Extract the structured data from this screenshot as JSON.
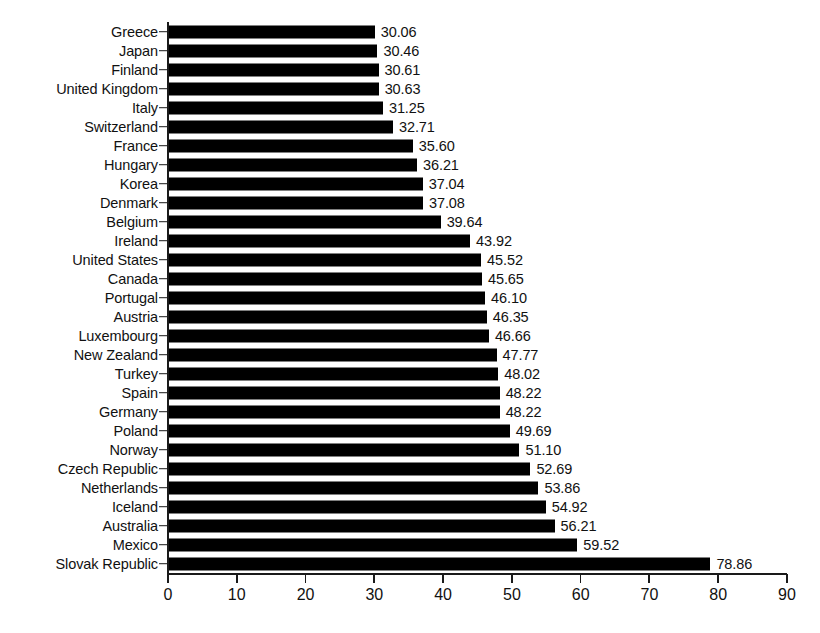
{
  "chart_data": {
    "type": "bar",
    "orientation": "horizontal",
    "title": "",
    "subtitle": "",
    "xlabel": "",
    "ylabel": "",
    "xlim": [
      0,
      90
    ],
    "xticks": [
      0,
      10,
      20,
      30,
      40,
      50,
      60,
      70,
      80,
      90
    ],
    "grid": false,
    "legend": null,
    "bar_color": "#000000",
    "axis_color": "#1a1a1a",
    "value_label_format": "0.00",
    "categories": [
      "Greece",
      "Japan",
      "Finland",
      "United Kingdom",
      "Italy",
      "Switzerland",
      "France",
      "Hungary",
      "Korea",
      "Denmark",
      "Belgium",
      "Ireland",
      "United States",
      "Canada",
      "Portugal",
      "Austria",
      "Luxembourg",
      "New Zealand",
      "Turkey",
      "Spain",
      "Germany",
      "Poland",
      "Norway",
      "Czech Republic",
      "Netherlands",
      "Iceland",
      "Australia",
      "Mexico",
      "Slovak Republic"
    ],
    "values": [
      30.06,
      30.46,
      30.61,
      30.63,
      31.25,
      32.71,
      35.6,
      36.21,
      37.04,
      37.08,
      39.64,
      43.92,
      45.52,
      45.65,
      46.1,
      46.35,
      46.66,
      47.77,
      48.02,
      48.22,
      48.22,
      49.69,
      51.1,
      52.69,
      53.86,
      54.92,
      56.21,
      59.52,
      78.86
    ],
    "value_labels": [
      "30.06",
      "30.46",
      "30.61",
      "30.63",
      "31.25",
      "32.71",
      "35.60",
      "36.21",
      "37.04",
      "37.08",
      "39.64",
      "43.92",
      "45.52",
      "45.65",
      "46.10",
      "46.35",
      "46.66",
      "47.77",
      "48.02",
      "48.22",
      "48.22",
      "49.69",
      "51.10",
      "52.69",
      "53.86",
      "54.92",
      "56.21",
      "59.52",
      "78.86"
    ],
    "xtick_labels": [
      "0",
      "10",
      "20",
      "30",
      "40",
      "50",
      "60",
      "70",
      "80",
      "90"
    ]
  }
}
